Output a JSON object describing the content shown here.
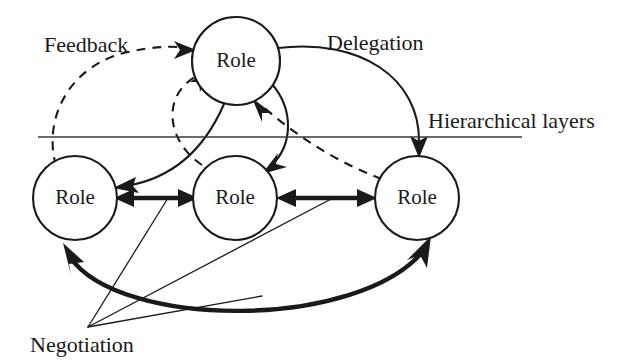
{
  "figure": {
    "background_color": "#ffffff",
    "ink_color": "#1a1a1a",
    "width": 625,
    "height": 364
  },
  "nodes": [
    {
      "id": "role-top",
      "label": "Role",
      "cx": 236,
      "cy": 61,
      "r": 44
    },
    {
      "id": "role-bottom-left",
      "label": "Role",
      "cx": 75,
      "cy": 198,
      "r": 42
    },
    {
      "id": "role-bottom-mid",
      "label": "Role",
      "cx": 235,
      "cy": 198,
      "r": 42
    },
    {
      "id": "role-bottom-right",
      "label": "Role",
      "cx": 417,
      "cy": 198,
      "r": 42
    }
  ],
  "annotations": {
    "feedback": {
      "text": "Feedback",
      "x": 44,
      "y": 52,
      "style": "dashed-edges"
    },
    "delegation": {
      "text": "Delegation",
      "x": 327,
      "y": 50,
      "style": "solid-edges"
    },
    "hierarchical_layers": {
      "text": "Hierarchical layers",
      "x": 428,
      "y": 128,
      "style": "divider-line"
    },
    "negotiation": {
      "text": "Negotiation",
      "x": 30,
      "y": 352,
      "style": "thick-double-arrows"
    }
  },
  "divider": {
    "name": "hierarchical-layer-divider",
    "x1": 38,
    "y1": 137,
    "x2": 522,
    "y2": 137
  },
  "edges": [
    {
      "id": "delegation-top-to-left",
      "kind": "delegation",
      "style": "solid",
      "from": "role-top",
      "to": "role-bottom-left",
      "arrows": "to"
    },
    {
      "id": "delegation-top-to-mid",
      "kind": "delegation",
      "style": "solid",
      "from": "role-top",
      "to": "role-bottom-mid",
      "arrows": "to"
    },
    {
      "id": "delegation-top-to-right",
      "kind": "delegation",
      "style": "solid",
      "from": "role-top",
      "to": "role-bottom-right",
      "arrows": "to"
    },
    {
      "id": "feedback-left-to-top",
      "kind": "feedback",
      "style": "dashed",
      "from": "role-bottom-left",
      "to": "role-top",
      "arrows": "to"
    },
    {
      "id": "feedback-mid-to-top",
      "kind": "feedback",
      "style": "dashed",
      "from": "role-bottom-mid",
      "to": "role-top",
      "arrows": "to"
    },
    {
      "id": "feedback-right-to-top",
      "kind": "feedback",
      "style": "dashed",
      "from": "role-bottom-right",
      "to": "role-top",
      "arrows": "to"
    },
    {
      "id": "negotiation-left-mid",
      "kind": "negotiation",
      "style": "thick",
      "from": "role-bottom-left",
      "to": "role-bottom-mid",
      "arrows": "both"
    },
    {
      "id": "negotiation-mid-right",
      "kind": "negotiation",
      "style": "thick",
      "from": "role-bottom-mid",
      "to": "role-bottom-right",
      "arrows": "both"
    },
    {
      "id": "negotiation-left-right",
      "kind": "negotiation",
      "style": "thick-arc",
      "from": "role-bottom-left",
      "to": "role-bottom-right",
      "arrows": "both"
    }
  ],
  "leader_lines": [
    {
      "id": "leader-to-left-mid-arrow",
      "from_x": 88,
      "from_y": 327,
      "to_x": 165,
      "to_y": 200
    },
    {
      "id": "leader-to-mid-right-arrow",
      "from_x": 88,
      "from_y": 327,
      "to_x": 330,
      "to_y": 200
    },
    {
      "id": "leader-to-arc",
      "from_x": 88,
      "from_y": 327,
      "to_x": 258,
      "to_y": 293
    }
  ]
}
